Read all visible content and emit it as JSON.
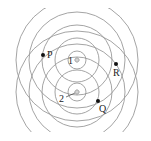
{
  "diagram": {
    "title": "",
    "type": "two-source wave interference",
    "sources": [
      {
        "label": "1",
        "x": 77,
        "y": 60
      },
      {
        "label": "2",
        "x": 77,
        "y": 92
      }
    ],
    "wavefront_radii": [
      9,
      22,
      35,
      48,
      61
    ],
    "points": [
      {
        "label": "P",
        "x": 43,
        "y": 55
      },
      {
        "label": "R",
        "x": 116,
        "y": 64
      },
      {
        "label": "Q",
        "x": 98,
        "y": 101
      }
    ],
    "colors": {
      "wavefront": "#9a9a9a",
      "point": "#111111",
      "background": "#ffffff"
    }
  }
}
